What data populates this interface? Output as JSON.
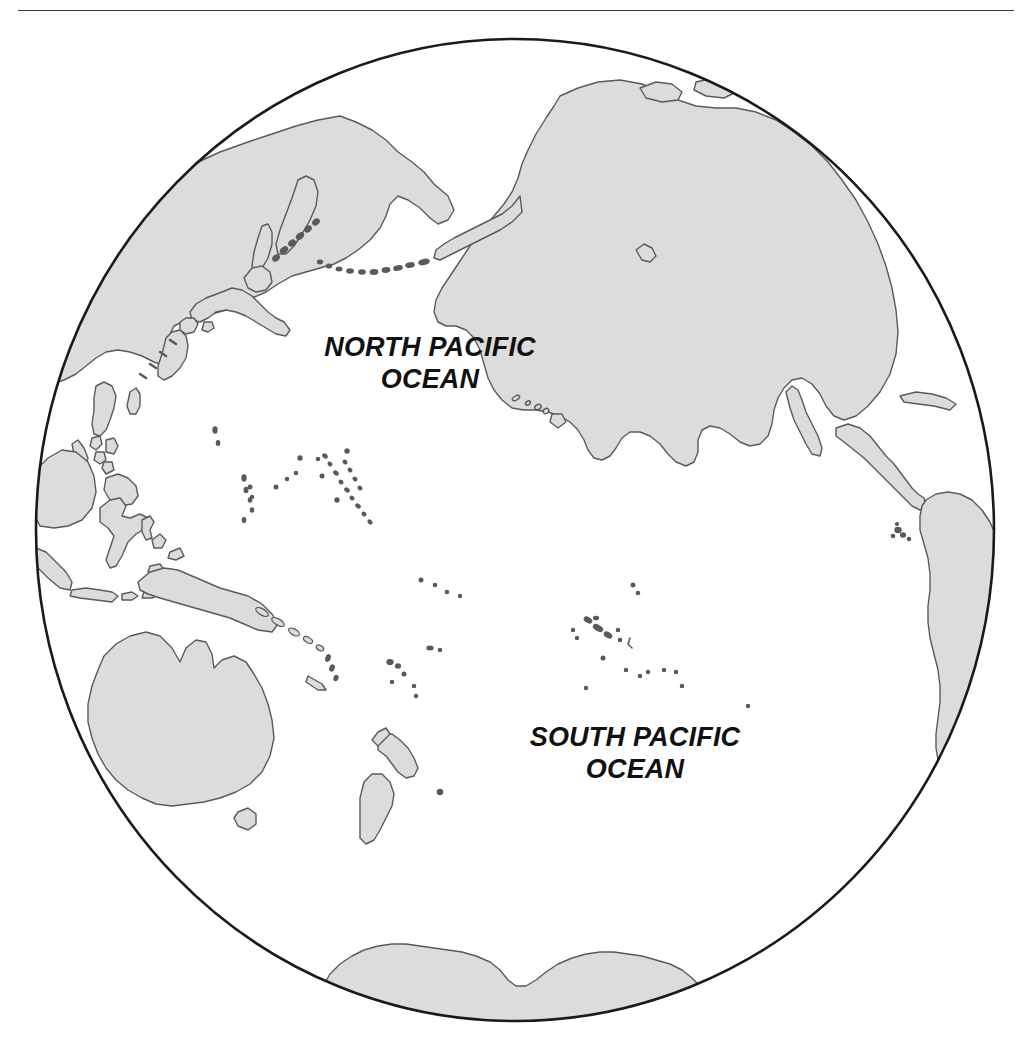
{
  "page": {
    "width": 1028,
    "height": 1045,
    "background_color": "#ffffff"
  },
  "top_rule": {
    "name": "horizontal-rule",
    "color": "#3a3a3a"
  },
  "map": {
    "title": "Pacific Ocean Hemisphere",
    "projection": "orthographic",
    "globe": {
      "center_x": 515,
      "center_y": 530,
      "radius_x": 480,
      "radius_y": 492,
      "outline_color": "#1a1a1a",
      "ocean_fill": "#ffffff"
    },
    "land": {
      "fill_color": "#dcdcdc",
      "outline_color": "#5a5a5a"
    },
    "labels": [
      {
        "name": "north-pacific-ocean-label",
        "text": "NORTH PACIFIC\nOCEAN",
        "x": 430,
        "y": 360
      },
      {
        "name": "south-pacific-ocean-label",
        "text": "SOUTH PACIFIC\nOCEAN",
        "x": 635,
        "y": 750
      }
    ],
    "features": [
      {
        "name": "north-america",
        "type": "continent"
      },
      {
        "name": "south-america",
        "type": "continent"
      },
      {
        "name": "asia-east",
        "type": "continent"
      },
      {
        "name": "australia",
        "type": "continent"
      },
      {
        "name": "antarctica",
        "type": "continent"
      },
      {
        "name": "new-guinea",
        "type": "island"
      },
      {
        "name": "new-zealand",
        "type": "island-group"
      },
      {
        "name": "japan",
        "type": "island-group"
      },
      {
        "name": "philippines",
        "type": "island-group"
      },
      {
        "name": "borneo",
        "type": "island"
      },
      {
        "name": "sulawesi",
        "type": "island"
      },
      {
        "name": "hawaiian-islands",
        "type": "island-group"
      },
      {
        "name": "aleutian-islands",
        "type": "island-group"
      },
      {
        "name": "kuril-islands",
        "type": "island-group"
      },
      {
        "name": "mariana-islands",
        "type": "island-group"
      },
      {
        "name": "caroline-islands",
        "type": "island-group"
      },
      {
        "name": "marshall-islands",
        "type": "island-group"
      },
      {
        "name": "solomon-islands",
        "type": "island-group"
      },
      {
        "name": "fiji-islands",
        "type": "island-group"
      },
      {
        "name": "french-polynesia",
        "type": "island-group"
      },
      {
        "name": "galapagos-islands",
        "type": "island-group"
      },
      {
        "name": "cuba",
        "type": "island"
      },
      {
        "name": "baja-california",
        "type": "peninsula"
      },
      {
        "name": "kamchatka-peninsula",
        "type": "peninsula"
      },
      {
        "name": "alaska-peninsula",
        "type": "peninsula"
      }
    ]
  }
}
